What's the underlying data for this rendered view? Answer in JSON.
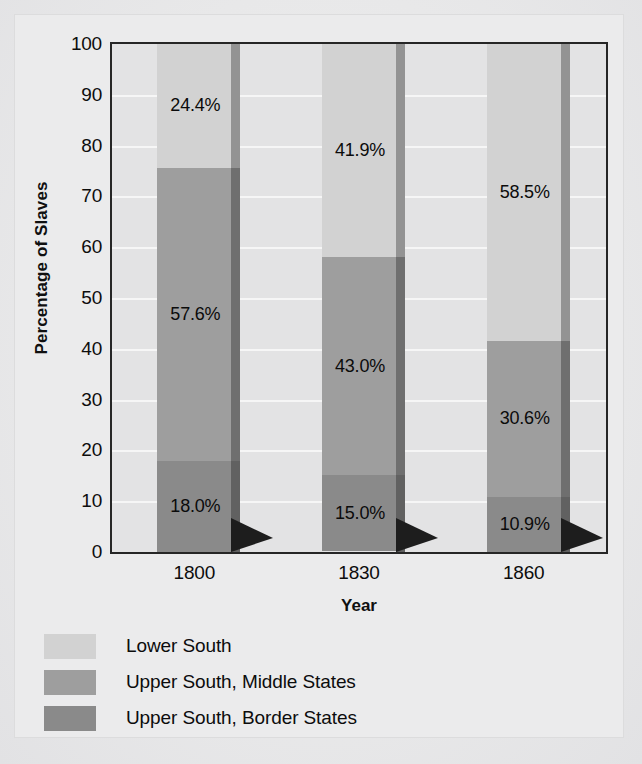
{
  "chart_data": {
    "type": "bar",
    "subtype": "stacked-100-percent",
    "title": "",
    "xlabel": "Year",
    "ylabel": "Percentage of Slaves",
    "categories": [
      "1800",
      "1830",
      "1860"
    ],
    "ylim": [
      0,
      100
    ],
    "yticks": [
      0,
      10,
      20,
      30,
      40,
      50,
      60,
      70,
      80,
      90,
      100
    ],
    "grid": true,
    "legend_position": "below",
    "series": [
      {
        "name": "Lower South",
        "color": "#d2d2d2",
        "values": [
          24.4,
          41.9,
          58.5
        ],
        "labels": [
          "24.4%",
          "41.9%",
          "58.5%"
        ]
      },
      {
        "name": "Upper South, Middle States",
        "color": "#9e9e9e",
        "values": [
          57.6,
          43.0,
          30.6
        ],
        "labels": [
          "57.6%",
          "43.0%",
          "30.6%"
        ]
      },
      {
        "name": "Upper South, Border States",
        "color": "#8a8a8a",
        "values": [
          18.0,
          15.0,
          10.9
        ],
        "labels": [
          "18.0%",
          "15.0%",
          "10.9%"
        ]
      }
    ]
  },
  "axis": {
    "y_title": "Percentage of Slaves",
    "x_title": "Year",
    "y_tick_labels": [
      "100",
      "90",
      "80",
      "70",
      "60",
      "50",
      "40",
      "30",
      "20",
      "10",
      "0"
    ],
    "x_tick_labels": [
      "1800",
      "1830",
      "1860"
    ]
  },
  "legend": {
    "items": [
      {
        "label": "Lower South",
        "color": "#d2d2d2"
      },
      {
        "label": "Upper South, Middle States",
        "color": "#9e9e9e"
      },
      {
        "label": "Upper South, Border States",
        "color": "#8a8a8a"
      }
    ]
  },
  "bars": [
    {
      "category": "1800",
      "segments": [
        {
          "series": "Lower South",
          "value": 24.4,
          "label": "24.4%",
          "color": "#d2d2d2"
        },
        {
          "series": "Upper South, Middle States",
          "value": 57.6,
          "label": "57.6%",
          "color": "#9e9e9e"
        },
        {
          "series": "Upper South, Border States",
          "value": 18.0,
          "label": "18.0%",
          "color": "#8a8a8a"
        }
      ]
    },
    {
      "category": "1830",
      "segments": [
        {
          "series": "Lower South",
          "value": 41.9,
          "label": "41.9%",
          "color": "#d2d2d2"
        },
        {
          "series": "Upper South, Middle States",
          "value": 43.0,
          "label": "43.0%",
          "color": "#9e9e9e"
        },
        {
          "series": "Upper South, Border States",
          "value": 15.0,
          "label": "15.0%",
          "color": "#8a8a8a"
        }
      ]
    },
    {
      "category": "1860",
      "segments": [
        {
          "series": "Lower South",
          "value": 58.5,
          "label": "58.5%",
          "color": "#d2d2d2"
        },
        {
          "series": "Upper South, Middle States",
          "value": 30.6,
          "label": "30.6%",
          "color": "#9e9e9e"
        },
        {
          "series": "Upper South, Border States",
          "value": 10.9,
          "label": "10.9%",
          "color": "#8a8a8a"
        }
      ]
    }
  ],
  "style": {
    "plot_background": "#e3e3e4",
    "page_background": "#ebebec",
    "gridline_color": "#f6f6f6",
    "axis_border_color": "#262626",
    "text_color": "#0d0d0d"
  }
}
